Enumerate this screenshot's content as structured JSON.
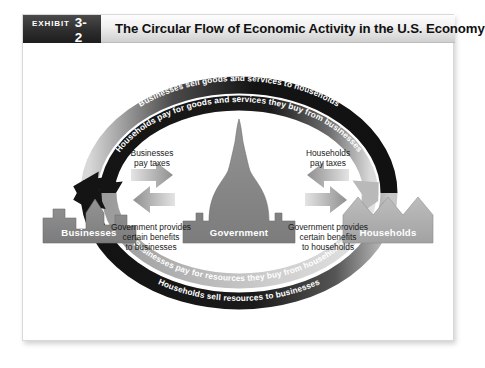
{
  "exhibit": {
    "word": "EXHIBIT",
    "number": "3-2",
    "title": "The Circular Flow of Economic Activity in the U.S. Economy"
  },
  "colors": {
    "badge_dark": "#2e2e2e",
    "band_dark": "#161616",
    "band_mid": "#6e6e6e",
    "band_light": "#c9c9c9",
    "node_fill": "#8a8a8a",
    "node_fill_light": "#b0b0b0",
    "arrow_gray": "#9a9a9a",
    "text_dark": "#1a1a1a",
    "panel_border": "#d9d9d9"
  },
  "nodes": [
    {
      "id": "businesses",
      "label": "Businesses",
      "shape": "city-skyline"
    },
    {
      "id": "government",
      "label": "Government",
      "shape": "capitol-dome"
    },
    {
      "id": "households",
      "label": "Households",
      "shape": "house-roofs"
    }
  ],
  "arcs": [
    {
      "id": "arc-top-outer",
      "label": "Businesses sell goods and services to households",
      "position": "top-outer",
      "direction": "left",
      "tone": "dark"
    },
    {
      "id": "arc-top-inner",
      "label": "Households pay for goods and services they buy from businesses",
      "position": "top-inner",
      "direction": "left",
      "tone": "dark"
    },
    {
      "id": "arc-bottom-inner",
      "label": "Businesses pay for resources they buy from households",
      "position": "bottom-inner",
      "direction": "up-right",
      "tone": "light"
    },
    {
      "id": "arc-bottom-outer",
      "label": "Households sell resources to businesses",
      "position": "bottom-outer",
      "direction": "up-left",
      "tone": "dark"
    }
  ],
  "flows": [
    {
      "id": "businesses-pay-taxes",
      "line1": "Businesses",
      "line2": "pay taxes",
      "line3": "",
      "direction": "right"
    },
    {
      "id": "households-pay-taxes",
      "line1": "Households",
      "line2": "pay taxes",
      "line3": "",
      "direction": "left"
    },
    {
      "id": "government-benefits-businesses",
      "line1": "Government provides",
      "line2": "certain benefits",
      "line3": "to businesses",
      "direction": "left"
    },
    {
      "id": "government-benefits-households",
      "line1": "Government provides",
      "line2": "certain benefits",
      "line3": "to households",
      "direction": "right"
    }
  ]
}
